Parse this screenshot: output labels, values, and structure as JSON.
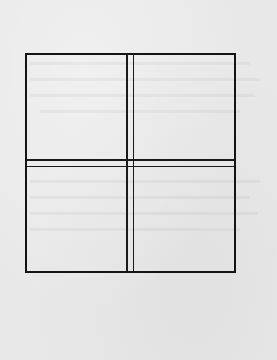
{
  "figure": {
    "type": "window-pane line drawing",
    "panes": [
      {
        "position": "top-left"
      },
      {
        "position": "top-right"
      },
      {
        "position": "bottom-left"
      },
      {
        "position": "bottom-right"
      }
    ],
    "stroke_color": "#141414",
    "background_color": "#e8e8e8"
  },
  "background_text": {
    "title_bleed": ""
  }
}
